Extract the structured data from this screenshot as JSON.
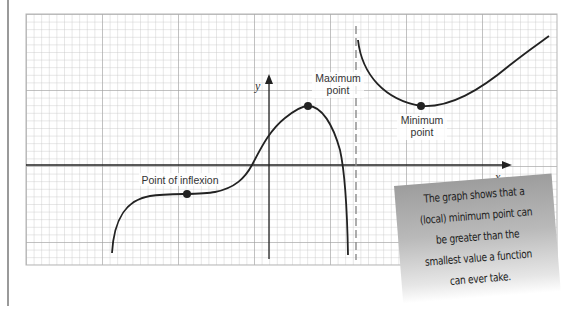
{
  "diagram": {
    "axes": {
      "x_label": "x",
      "y_label": "y"
    },
    "annotations": {
      "maximum": [
        "Maximum",
        "point"
      ],
      "minimum": [
        "Minimum",
        "point"
      ],
      "inflexion": "Point of inflexion"
    },
    "note": {
      "lines": [
        "The graph shows that a",
        "(local) minimum point can",
        "be greater than the",
        "smallest value a function",
        "can ever take."
      ]
    },
    "colors": {
      "grid_minor": "#c8c8c8",
      "grid_major": "#9a9a9a",
      "curve": "#222222",
      "note_bg_top": "#9d9d9d",
      "note_bg_bottom": "#ffffff"
    }
  }
}
